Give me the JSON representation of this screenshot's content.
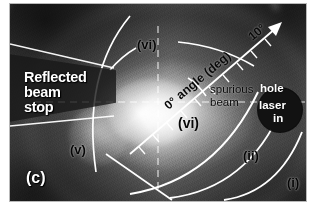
{
  "figure": {
    "panel_label": "(c)"
  },
  "annotations": {
    "beam_stop": "Reflected\nbeam\nstop",
    "beam_stop_line1": "Reflected",
    "beam_stop_line2": "beam",
    "beam_stop_line3": "stop",
    "spurious_line1": "spurious",
    "spurious_line2": "beam",
    "feature_vi_top": "(vi)",
    "feature_vi_mid": "(vi)",
    "feature_v": "(v)",
    "feature_ii": "(ii)",
    "feature_i": "(i)"
  },
  "axis": {
    "start_label": "0°",
    "title": "angle (deg)",
    "end_label": "10°",
    "tick_count": 10,
    "arrow": "arrow-up-right"
  },
  "badge": {
    "line1": "hole",
    "line2": "laser",
    "line3": "in",
    "color": "#121212",
    "text_color": "#ffffff"
  },
  "colors": {
    "plate_dark": "#3a3a3a",
    "plate_mid": "#5b5b5b",
    "overlay_white": "#ffffff",
    "label_black": "#0b0b0b",
    "background": "#ffffff"
  }
}
